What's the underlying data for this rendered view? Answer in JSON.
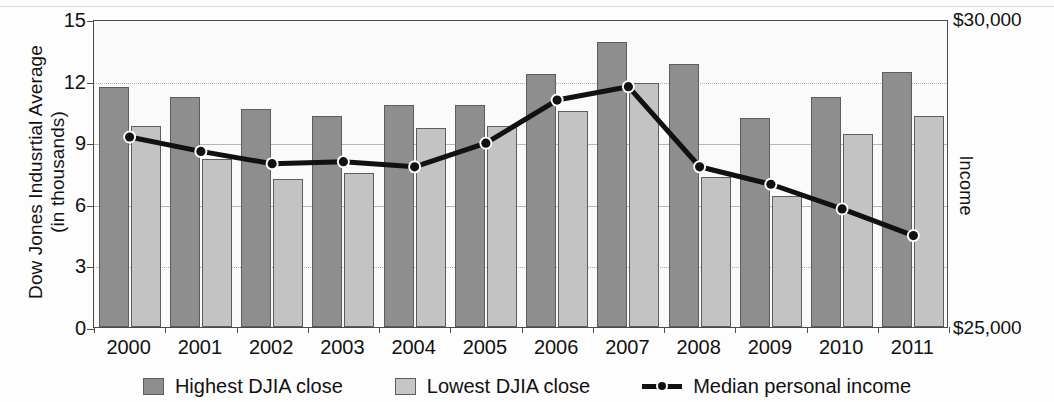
{
  "chart_data": {
    "type": "bar",
    "title": "",
    "ylabel": "Dow Jones Indusrtial Average\n(in thousands)",
    "ylabel_right": "Income",
    "xlabel": "",
    "categories": [
      "2000",
      "2001",
      "2002",
      "2003",
      "2004",
      "2005",
      "2006",
      "2007",
      "2008",
      "2009",
      "2010",
      "2011"
    ],
    "ylim": [
      0,
      15
    ],
    "yticks": [
      0,
      3,
      6,
      9,
      12,
      15
    ],
    "ytick_labels": [
      "0",
      "3",
      "6",
      "9",
      "12",
      "15"
    ],
    "ylim_right": [
      25000,
      30000
    ],
    "yticks_right": [
      25000,
      30000
    ],
    "ytick_labels_right": [
      "$25,000",
      "$30,000"
    ],
    "grid": true,
    "legend_position": "bottom",
    "series": [
      {
        "name": "Highest DJIA close",
        "type": "bar",
        "color": "#8e8e8e",
        "values": [
          11.7,
          11.2,
          10.6,
          10.3,
          10.8,
          10.8,
          12.3,
          13.9,
          12.8,
          10.2,
          11.2,
          12.4
        ]
      },
      {
        "name": "Lowest DJIA close",
        "type": "bar",
        "color": "#c3c3c3",
        "values": [
          9.8,
          8.2,
          7.2,
          7.5,
          9.7,
          9.8,
          10.5,
          11.9,
          7.3,
          6.4,
          9.4,
          10.3
        ]
      },
      {
        "name": "Median personal income",
        "type": "line",
        "color": "#111111",
        "axis": "right",
        "values": [
          9.35,
          8.65,
          8.05,
          8.15,
          7.9,
          9.05,
          11.15,
          11.8,
          7.9,
          7.05,
          5.85,
          4.55
        ]
      }
    ]
  },
  "legend": {
    "items": [
      {
        "label": "Highest DJIA close",
        "marker": "square-swatch-dark"
      },
      {
        "label": "Lowest DJIA close",
        "marker": "square-swatch-light"
      },
      {
        "label": "Median personal income",
        "marker": "line-with-dot-marker"
      }
    ]
  }
}
